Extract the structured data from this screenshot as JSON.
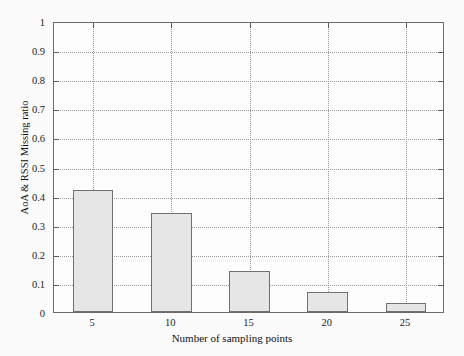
{
  "chart_data": {
    "type": "bar",
    "title": "",
    "xlabel": "Number of sampling points",
    "ylabel": "AoA & RSSI Missing ratio",
    "categories": [
      "5",
      "10",
      "15",
      "20",
      "25"
    ],
    "values": [
      0.42,
      0.34,
      0.14,
      0.07,
      0.03
    ],
    "series": [
      {
        "name": "AoA & RSSI Missing ratio",
        "values": [
          0.42,
          0.34,
          0.14,
          0.07,
          0.03
        ]
      }
    ],
    "ylim": [
      0,
      1
    ],
    "xlim": [
      2.5,
      27.5
    ],
    "ytick_labels": [
      "0",
      "0.1",
      "0.2",
      "0.3",
      "0.4",
      "0.5",
      "0.6",
      "0.7",
      "0.8",
      "0.9",
      "1"
    ],
    "ytick_values": [
      0,
      0.1,
      0.2,
      0.3,
      0.4,
      0.5,
      0.6,
      0.7,
      0.8,
      0.9,
      1
    ],
    "xtick_labels": [
      "5",
      "10",
      "15",
      "20",
      "25"
    ],
    "xtick_values": [
      5,
      10,
      15,
      20,
      25
    ],
    "grid": true,
    "grid_style": "dotted",
    "legend": null,
    "legend_position": "none",
    "colors": {
      "bar_fill": "#e6e6e6",
      "bar_edge": "#707070",
      "grid": "#9a9a9a",
      "axis": "#6b6b6b",
      "text": "#1a1a1a",
      "background": "#fbfbfb",
      "plot_background": "#fdfdfd"
    }
  }
}
